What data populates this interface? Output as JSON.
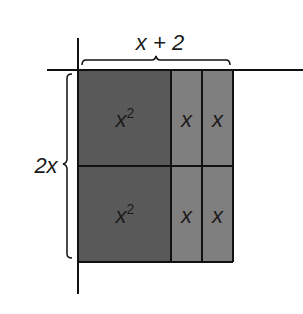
{
  "diagram": {
    "type": "area-model",
    "top_label": "x + 2",
    "side_label": "2x",
    "colors": {
      "large_tile": "#595959",
      "small_tile": "#7f7f7f",
      "line": "#111111",
      "background": "#ffffff"
    },
    "cells": [
      {
        "row": 0,
        "col": 0,
        "label_base": "x",
        "label_sup": "2"
      },
      {
        "row": 0,
        "col": 1,
        "label_base": "x",
        "label_sup": ""
      },
      {
        "row": 0,
        "col": 2,
        "label_base": "x",
        "label_sup": ""
      },
      {
        "row": 1,
        "col": 0,
        "label_base": "x",
        "label_sup": "2"
      },
      {
        "row": 1,
        "col": 1,
        "label_base": "x",
        "label_sup": ""
      },
      {
        "row": 1,
        "col": 2,
        "label_base": "x",
        "label_sup": ""
      }
    ]
  }
}
